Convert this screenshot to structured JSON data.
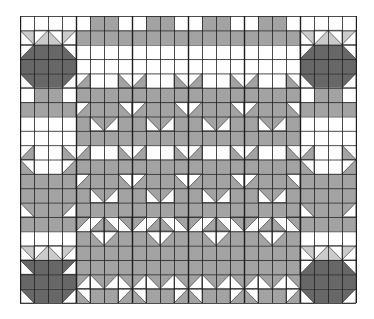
{
  "figure": {
    "cols": 24,
    "rows": 20,
    "colors": {
      "W": "#ffffff",
      "M": "#a3a3a3",
      "D": "#676767",
      "L": "#cbcbcb",
      "line": "#1e1e1e"
    },
    "grid": [
      "WWWWWMMWWMMWWMMWWMMWWWWW",
      "LLLLMMMMMMMMMMMMMMMMLLLL",
      "DDDDWWWWWWWWWWWWWWWWDDDD",
      "DDDDWWWWWWWWWWWWWWWWDDDD",
      "DDDDWWWWWWWWWWWWWWWWDDDD",
      "WMMWMMMMMMMMMMMMMMMMWMMW",
      "MMMMMMMMMMMMMMMMMMMMMMMM",
      "WWWWMMMMMMMMMMMMMMMMWWWW",
      "WWWWMMMMMMMMMMMMMMMMWWWW",
      "WWWWWWWWWWWWWWWWWWWWWWWW",
      "MWWMMMMMMMMMMMMMMMMMMWWM",
      "MMMMMMMMMMMMMMMMMMMMMMMM",
      "MMMMMMMMMMMMMMMMMMMMMMMM",
      "MMMMMMMMMMMMMMMMMMMMMMMM",
      "MMMMWWWWWWWWWWWWWWWWMMMM",
      "WWWWMMMMMMMMMMMMMMMMWWWW",
      "LLLLMMMMMMMMMMMMMMMMLLLL",
      "DDDDMMMMMMMMMMMMMMMMDDDD",
      "DDDDMMMMMMMMMMMMMMMMDDDD",
      "DDDDMMMMMMMMMMMMMMMMDDDD"
    ],
    "triangles": [
      {
        "r": 17,
        "c": 0,
        "corner": "bl",
        "fill": "W"
      },
      {
        "r": 17,
        "c": 3,
        "corner": "br",
        "fill": "W"
      },
      {
        "r": 19,
        "c": 0,
        "corner": "bl",
        "fill": "W"
      },
      {
        "r": 19,
        "c": 3,
        "corner": "br",
        "fill": "W"
      },
      {
        "r": 2,
        "c": 0,
        "corner": "tl",
        "fill": "W"
      },
      {
        "r": 2,
        "c": 3,
        "corner": "tr",
        "fill": "W"
      },
      {
        "r": 4,
        "c": 0,
        "corner": "bl",
        "fill": "W"
      },
      {
        "r": 4,
        "c": 3,
        "corner": "br",
        "fill": "W"
      },
      {
        "r": 2,
        "c": 20,
        "corner": "tl",
        "fill": "W"
      },
      {
        "r": 2,
        "c": 23,
        "corner": "tr",
        "fill": "W"
      },
      {
        "r": 4,
        "c": 20,
        "corner": "bl",
        "fill": "W"
      },
      {
        "r": 4,
        "c": 23,
        "corner": "br",
        "fill": "W"
      },
      {
        "r": 17,
        "c": 20,
        "corner": "tl",
        "fill": "W"
      },
      {
        "r": 17,
        "c": 23,
        "corner": "tr",
        "fill": "W"
      },
      {
        "r": 19,
        "c": 20,
        "corner": "bl",
        "fill": "W"
      },
      {
        "r": 19,
        "c": 23,
        "corner": "br",
        "fill": "W"
      },
      {
        "r": 1,
        "c": 0,
        "corner": "bl",
        "fill": "W"
      },
      {
        "r": 1,
        "c": 1,
        "corner": "tl",
        "fill": "W"
      },
      {
        "r": 1,
        "c": 2,
        "corner": "tr",
        "fill": "W"
      },
      {
        "r": 1,
        "c": 3,
        "corner": "br",
        "fill": "W"
      },
      {
        "r": 1,
        "c": 20,
        "corner": "bl",
        "fill": "W"
      },
      {
        "r": 1,
        "c": 21,
        "corner": "tl",
        "fill": "W"
      },
      {
        "r": 1,
        "c": 22,
        "corner": "tr",
        "fill": "W"
      },
      {
        "r": 1,
        "c": 23,
        "corner": "br",
        "fill": "W"
      },
      {
        "r": 16,
        "c": 0,
        "corner": "bl",
        "fill": "W"
      },
      {
        "r": 16,
        "c": 1,
        "corner": "tl",
        "fill": "W"
      },
      {
        "r": 16,
        "c": 2,
        "corner": "tr",
        "fill": "W"
      },
      {
        "r": 16,
        "c": 3,
        "corner": "br",
        "fill": "W"
      },
      {
        "r": 16,
        "c": 20,
        "corner": "bl",
        "fill": "W"
      },
      {
        "r": 16,
        "c": 21,
        "corner": "tl",
        "fill": "W"
      },
      {
        "r": 16,
        "c": 22,
        "corner": "tr",
        "fill": "W"
      },
      {
        "r": 16,
        "c": 23,
        "corner": "br",
        "fill": "W"
      },
      {
        "r": 4,
        "c": 4,
        "corner": "br",
        "fill": "M"
      },
      {
        "r": 4,
        "c": 7,
        "corner": "bl",
        "fill": "M"
      },
      {
        "r": 4,
        "c": 8,
        "corner": "br",
        "fill": "M"
      },
      {
        "r": 4,
        "c": 11,
        "corner": "bl",
        "fill": "M"
      },
      {
        "r": 4,
        "c": 12,
        "corner": "br",
        "fill": "M"
      },
      {
        "r": 4,
        "c": 15,
        "corner": "bl",
        "fill": "M"
      },
      {
        "r": 4,
        "c": 16,
        "corner": "br",
        "fill": "M"
      },
      {
        "r": 4,
        "c": 19,
        "corner": "bl",
        "fill": "M"
      },
      {
        "r": 6,
        "c": 4,
        "corner": "tl",
        "fill": "W"
      },
      {
        "r": 6,
        "c": 7,
        "corner": "tr",
        "fill": "W"
      },
      {
        "r": 6,
        "c": 8,
        "corner": "tl",
        "fill": "W"
      },
      {
        "r": 6,
        "c": 11,
        "corner": "tr",
        "fill": "W"
      },
      {
        "r": 6,
        "c": 12,
        "corner": "tl",
        "fill": "W"
      },
      {
        "r": 6,
        "c": 15,
        "corner": "tr",
        "fill": "W"
      },
      {
        "r": 6,
        "c": 16,
        "corner": "tl",
        "fill": "W"
      },
      {
        "r": 6,
        "c": 19,
        "corner": "tr",
        "fill": "W"
      },
      {
        "r": 7,
        "c": 5,
        "corner": "bl",
        "fill": "W"
      },
      {
        "r": 7,
        "c": 6,
        "corner": "br",
        "fill": "W"
      },
      {
        "r": 7,
        "c": 9,
        "corner": "bl",
        "fill": "W"
      },
      {
        "r": 7,
        "c": 10,
        "corner": "br",
        "fill": "W"
      },
      {
        "r": 7,
        "c": 13,
        "corner": "bl",
        "fill": "W"
      },
      {
        "r": 7,
        "c": 14,
        "corner": "br",
        "fill": "W"
      },
      {
        "r": 7,
        "c": 17,
        "corner": "bl",
        "fill": "W"
      },
      {
        "r": 7,
        "c": 18,
        "corner": "br",
        "fill": "W"
      },
      {
        "r": 9,
        "c": 0,
        "corner": "br",
        "fill": "M"
      },
      {
        "r": 9,
        "c": 3,
        "corner": "bl",
        "fill": "M"
      },
      {
        "r": 9,
        "c": 20,
        "corner": "br",
        "fill": "M"
      },
      {
        "r": 9,
        "c": 23,
        "corner": "bl",
        "fill": "M"
      },
      {
        "r": 9,
        "c": 4,
        "corner": "br",
        "fill": "M"
      },
      {
        "r": 9,
        "c": 7,
        "corner": "bl",
        "fill": "M"
      },
      {
        "r": 9,
        "c": 8,
        "corner": "br",
        "fill": "M"
      },
      {
        "r": 9,
        "c": 11,
        "corner": "bl",
        "fill": "M"
      },
      {
        "r": 9,
        "c": 12,
        "corner": "br",
        "fill": "M"
      },
      {
        "r": 9,
        "c": 15,
        "corner": "bl",
        "fill": "M"
      },
      {
        "r": 9,
        "c": 16,
        "corner": "br",
        "fill": "M"
      },
      {
        "r": 9,
        "c": 19,
        "corner": "bl",
        "fill": "M"
      },
      {
        "r": 10,
        "c": 0,
        "corner": "tr",
        "fill": "W"
      },
      {
        "r": 10,
        "c": 3,
        "corner": "tl",
        "fill": "W"
      },
      {
        "r": 10,
        "c": 20,
        "corner": "tr",
        "fill": "W"
      },
      {
        "r": 10,
        "c": 23,
        "corner": "tl",
        "fill": "W"
      },
      {
        "r": 11,
        "c": 4,
        "corner": "tl",
        "fill": "W"
      },
      {
        "r": 11,
        "c": 7,
        "corner": "tr",
        "fill": "W"
      },
      {
        "r": 11,
        "c": 8,
        "corner": "tl",
        "fill": "W"
      },
      {
        "r": 11,
        "c": 11,
        "corner": "tr",
        "fill": "W"
      },
      {
        "r": 11,
        "c": 12,
        "corner": "tl",
        "fill": "W"
      },
      {
        "r": 11,
        "c": 15,
        "corner": "tr",
        "fill": "W"
      },
      {
        "r": 11,
        "c": 16,
        "corner": "tl",
        "fill": "W"
      },
      {
        "r": 11,
        "c": 19,
        "corner": "tr",
        "fill": "W"
      },
      {
        "r": 12,
        "c": 5,
        "corner": "bl",
        "fill": "W"
      },
      {
        "r": 12,
        "c": 6,
        "corner": "br",
        "fill": "W"
      },
      {
        "r": 12,
        "c": 9,
        "corner": "bl",
        "fill": "W"
      },
      {
        "r": 12,
        "c": 10,
        "corner": "br",
        "fill": "W"
      },
      {
        "r": 12,
        "c": 13,
        "corner": "bl",
        "fill": "W"
      },
      {
        "r": 12,
        "c": 14,
        "corner": "br",
        "fill": "W"
      },
      {
        "r": 12,
        "c": 17,
        "corner": "bl",
        "fill": "W"
      },
      {
        "r": 12,
        "c": 18,
        "corner": "br",
        "fill": "W"
      },
      {
        "r": 13,
        "c": 0,
        "corner": "bl",
        "fill": "W"
      },
      {
        "r": 13,
        "c": 3,
        "corner": "br",
        "fill": "W"
      },
      {
        "r": 13,
        "c": 20,
        "corner": "bl",
        "fill": "W"
      },
      {
        "r": 13,
        "c": 23,
        "corner": "br",
        "fill": "W"
      },
      {
        "r": 14,
        "c": 4,
        "corner": "tl",
        "fill": "M"
      },
      {
        "r": 14,
        "c": 7,
        "corner": "tr",
        "fill": "M"
      },
      {
        "r": 14,
        "c": 8,
        "corner": "tl",
        "fill": "M"
      },
      {
        "r": 14,
        "c": 11,
        "corner": "tr",
        "fill": "M"
      },
      {
        "r": 14,
        "c": 12,
        "corner": "tl",
        "fill": "M"
      },
      {
        "r": 14,
        "c": 15,
        "corner": "tr",
        "fill": "M"
      },
      {
        "r": 14,
        "c": 16,
        "corner": "tl",
        "fill": "M"
      },
      {
        "r": 14,
        "c": 19,
        "corner": "tr",
        "fill": "M"
      },
      {
        "r": 14,
        "c": 5,
        "corner": "br",
        "fill": "M"
      },
      {
        "r": 14,
        "c": 6,
        "corner": "bl",
        "fill": "M"
      },
      {
        "r": 14,
        "c": 9,
        "corner": "br",
        "fill": "M"
      },
      {
        "r": 14,
        "c": 10,
        "corner": "bl",
        "fill": "M"
      },
      {
        "r": 14,
        "c": 13,
        "corner": "br",
        "fill": "M"
      },
      {
        "r": 14,
        "c": 14,
        "corner": "bl",
        "fill": "M"
      },
      {
        "r": 14,
        "c": 17,
        "corner": "br",
        "fill": "M"
      },
      {
        "r": 14,
        "c": 18,
        "corner": "bl",
        "fill": "M"
      },
      {
        "r": 15,
        "c": 5,
        "corner": "tr",
        "fill": "W"
      },
      {
        "r": 15,
        "c": 6,
        "corner": "tl",
        "fill": "W"
      },
      {
        "r": 15,
        "c": 9,
        "corner": "tr",
        "fill": "W"
      },
      {
        "r": 15,
        "c": 10,
        "corner": "tl",
        "fill": "W"
      },
      {
        "r": 15,
        "c": 13,
        "corner": "tr",
        "fill": "W"
      },
      {
        "r": 15,
        "c": 14,
        "corner": "tl",
        "fill": "W"
      },
      {
        "r": 15,
        "c": 17,
        "corner": "tr",
        "fill": "W"
      },
      {
        "r": 15,
        "c": 18,
        "corner": "tl",
        "fill": "W"
      },
      {
        "r": 18,
        "c": 4,
        "corner": "br",
        "fill": "W"
      },
      {
        "r": 18,
        "c": 7,
        "corner": "bl",
        "fill": "W"
      },
      {
        "r": 18,
        "c": 8,
        "corner": "br",
        "fill": "W"
      },
      {
        "r": 18,
        "c": 11,
        "corner": "bl",
        "fill": "W"
      },
      {
        "r": 18,
        "c": 12,
        "corner": "br",
        "fill": "W"
      },
      {
        "r": 18,
        "c": 15,
        "corner": "bl",
        "fill": "W"
      },
      {
        "r": 18,
        "c": 16,
        "corner": "br",
        "fill": "W"
      },
      {
        "r": 18,
        "c": 19,
        "corner": "bl",
        "fill": "W"
      },
      {
        "r": 19,
        "c": 4,
        "corner": "tr",
        "fill": "W"
      },
      {
        "r": 19,
        "c": 7,
        "corner": "tl",
        "fill": "W"
      },
      {
        "r": 19,
        "c": 8,
        "corner": "tr",
        "fill": "W"
      },
      {
        "r": 19,
        "c": 11,
        "corner": "tl",
        "fill": "W"
      },
      {
        "r": 19,
        "c": 12,
        "corner": "tr",
        "fill": "W"
      },
      {
        "r": 19,
        "c": 15,
        "corner": "tl",
        "fill": "W"
      },
      {
        "r": 19,
        "c": 16,
        "corner": "tr",
        "fill": "W"
      },
      {
        "r": 19,
        "c": 19,
        "corner": "tl",
        "fill": "W"
      },
      {
        "r": 18,
        "c": 5,
        "corner": "bl",
        "fill": "W"
      },
      {
        "r": 18,
        "c": 6,
        "corner": "br",
        "fill": "W"
      },
      {
        "r": 18,
        "c": 9,
        "corner": "bl",
        "fill": "W"
      },
      {
        "r": 18,
        "c": 10,
        "corner": "br",
        "fill": "W"
      },
      {
        "r": 18,
        "c": 13,
        "corner": "bl",
        "fill": "W"
      },
      {
        "r": 18,
        "c": 14,
        "corner": "br",
        "fill": "W"
      },
      {
        "r": 18,
        "c": 17,
        "corner": "bl",
        "fill": "W"
      },
      {
        "r": 18,
        "c": 18,
        "corner": "br",
        "fill": "W"
      }
    ]
  }
}
